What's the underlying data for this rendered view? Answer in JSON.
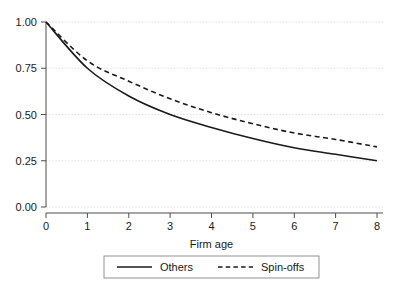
{
  "chart_data": {
    "type": "line",
    "title": "",
    "subtitle": "",
    "xlabel": "Firm age",
    "ylabel": "",
    "xlim": [
      0,
      8
    ],
    "ylim": [
      0,
      1
    ],
    "grid": true,
    "grid_axis": "y",
    "legend_position": "bottom-center",
    "x_ticks": [
      "0",
      "1",
      "2",
      "3",
      "4",
      "5",
      "6",
      "7",
      "8"
    ],
    "y_ticks": [
      "0.00",
      "0.25",
      "0.50",
      "0.75",
      "1.00"
    ],
    "x": [
      0,
      1,
      2,
      3,
      4,
      5,
      6,
      7,
      8
    ],
    "series": [
      {
        "name": "Others",
        "style": "solid",
        "color": "#1a1a1a",
        "values": [
          1.0,
          0.75,
          0.6,
          0.5,
          0.43,
          0.37,
          0.32,
          0.285,
          0.25
        ]
      },
      {
        "name": "Spin-offs",
        "style": "dashed",
        "color": "#1a1a1a",
        "values": [
          1.0,
          0.79,
          0.68,
          0.585,
          0.51,
          0.45,
          0.4,
          0.365,
          0.325
        ]
      }
    ],
    "annotations": []
  },
  "legend": {
    "entries": [
      {
        "label": "Others",
        "style": "solid"
      },
      {
        "label": "Spin-offs",
        "style": "dashed"
      }
    ]
  }
}
